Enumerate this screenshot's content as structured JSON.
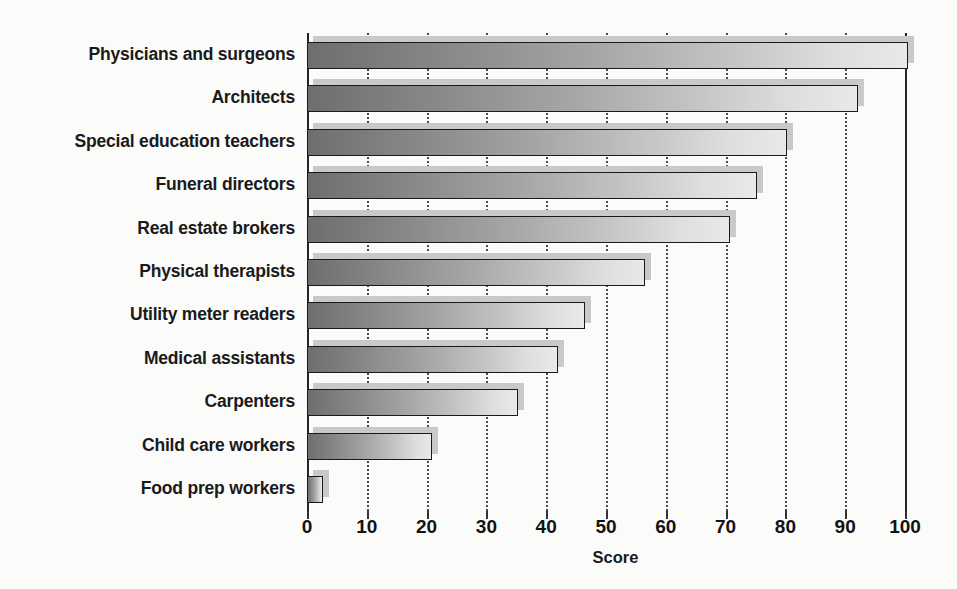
{
  "chart_data": {
    "type": "bar",
    "orientation": "horizontal",
    "title": "",
    "xlabel": "Score",
    "ylabel": "",
    "xlim": [
      0,
      100
    ],
    "xticks": [
      0,
      10,
      20,
      30,
      40,
      50,
      60,
      70,
      80,
      90,
      100
    ],
    "xtick_labels": [
      "0",
      "10",
      "20",
      "30",
      "40",
      "50",
      "60",
      "70",
      "80",
      "90",
      "100"
    ],
    "grid": "vertical-dotted",
    "legend": "none",
    "categories": [
      "Physicians and surgeons",
      "Architects",
      "Special education teachers",
      "Funeral directors",
      "Real estate brokers",
      "Physical therapists",
      "Utility meter readers",
      "Medical assistants",
      "Carpenters",
      "Child care workers",
      "Food prep workers"
    ],
    "values": [
      100.5,
      92.2,
      80.3,
      75.2,
      70.7,
      56.5,
      46.5,
      42.0,
      35.3,
      20.9,
      2.7
    ],
    "bars": [
      {
        "label": "Physicians and surgeons",
        "value": 100.5
      },
      {
        "label": "Architects",
        "value": 92.2
      },
      {
        "label": "Special education teachers",
        "value": 80.3
      },
      {
        "label": "Funeral directors",
        "value": 75.2
      },
      {
        "label": "Real estate brokers",
        "value": 70.7
      },
      {
        "label": "Physical therapists",
        "value": 56.5
      },
      {
        "label": "Utility meter readers",
        "value": 46.5
      },
      {
        "label": "Medical assistants",
        "value": 42.0
      },
      {
        "label": "Carpenters",
        "value": 35.3
      },
      {
        "label": "Child care workers",
        "value": 20.9
      },
      {
        "label": "Food prep workers",
        "value": 2.7
      }
    ],
    "colors": {
      "background": "#fbfbfa",
      "bar_gradient_start": "#6e6e6e",
      "bar_gradient_end": "#e9e9e9",
      "bar_outline": "#1a1a1a",
      "bar_shadow": "#c9c9c9",
      "gridline": "#4a4a4a",
      "axis": "#262626",
      "text": "#1a1a1a"
    }
  }
}
